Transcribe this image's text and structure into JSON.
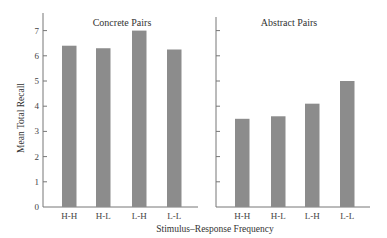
{
  "chart_data": [
    {
      "type": "bar",
      "title": "Concrete Pairs",
      "categories": [
        "H-H",
        "H-L",
        "L-H",
        "L-L"
      ],
      "values": [
        6.4,
        6.3,
        7.0,
        6.25
      ],
      "xlabel": "Stimulus–Response Frequency",
      "ylabel": "Mean Total Recall",
      "ylim": [
        0,
        7.5
      ],
      "yticks": [
        0,
        1,
        2,
        3,
        4,
        5,
        6,
        7
      ],
      "grid": false,
      "bar_color": "#8c8c8c"
    },
    {
      "type": "bar",
      "title": "Abstract Pairs",
      "categories": [
        "H-H",
        "H-L",
        "L-H",
        "L-L"
      ],
      "values": [
        3.5,
        3.6,
        4.1,
        5.0
      ],
      "xlabel": "Stimulus–Response Frequency",
      "ylabel": "Mean Total Recall",
      "ylim": [
        0,
        7.5
      ],
      "yticks": [
        0,
        1,
        2,
        3,
        4,
        5,
        6,
        7
      ],
      "grid": false,
      "bar_color": "#8c8c8c"
    }
  ],
  "labels": {
    "ylabel": "Mean Total Recall",
    "xlabel": "Stimulus–Response Frequency",
    "left_title": "Concrete Pairs",
    "right_title": "Abstract Pairs"
  }
}
